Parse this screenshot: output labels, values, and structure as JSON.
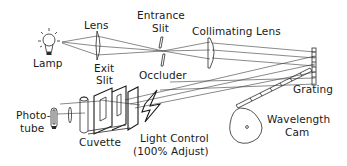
{
  "diagram": {
    "labels": {
      "lamp": "Lamp",
      "lens": "Lens",
      "entrance_slit_1": "Entrance",
      "entrance_slit_2": "Slit",
      "collimating_lens": "Collimating Lens",
      "exit_slit_1": "Exit",
      "exit_slit_2": "Slit",
      "occluder": "Occluder",
      "grating": "Grating",
      "phototube_1": "Photo-",
      "phototube_2": "tube",
      "cuvette": "Cuvette",
      "light_control_1": "Light Control",
      "light_control_2": "(100% Adjust)",
      "wavelength_cam_1": "Wavelength",
      "wavelength_cam_2": "Cam"
    },
    "colors": {
      "line": "#2a2a2a",
      "text": "#1a1a1a",
      "background": "#ffffff"
    }
  }
}
